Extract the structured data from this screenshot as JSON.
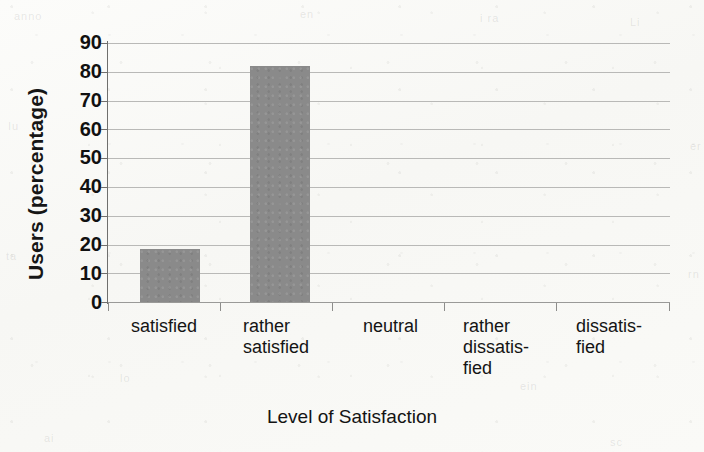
{
  "chart_data": {
    "type": "bar",
    "title": "",
    "xlabel": "Level of Satisfaction",
    "ylabel": "Users (percentage)",
    "categories": [
      "satisfied",
      "rather satisfied",
      "neutral",
      "rather dissatisfied",
      "dissatisfied"
    ],
    "category_labels_wrapped": [
      "satisfied",
      "rather\nsatisfied",
      "neutral",
      "rather\ndissatis-\nfied",
      "dissatis-\nfied"
    ],
    "values": [
      18.5,
      82,
      0,
      0,
      0
    ],
    "ylim": [
      0,
      90
    ],
    "yticks": [
      0,
      10,
      20,
      30,
      40,
      50,
      60,
      70,
      80,
      90
    ],
    "ytick_labels": [
      "0",
      "10",
      "20",
      "30",
      "40",
      "50",
      "60",
      "70",
      "80",
      "90"
    ],
    "grid": true,
    "grid_axis": "y",
    "legend": false,
    "legend_position": "none",
    "bar_color": "#8a8a8a",
    "grid_color": "#b9b9b7",
    "axis_color": "#6f6f6d",
    "background_color": "#fbfbf9",
    "text_color": "#141414"
  },
  "ghost_marks": [
    {
      "text": "anno",
      "x": 14,
      "y": 10
    },
    {
      "text": "en",
      "x": 300,
      "y": 8
    },
    {
      "text": "i ra",
      "x": 480,
      "y": 12
    },
    {
      "text": "Li",
      "x": 630,
      "y": 16
    },
    {
      "text": "Iu",
      "x": 8,
      "y": 120
    },
    {
      "text": "er",
      "x": 690,
      "y": 140
    },
    {
      "text": "ta",
      "x": 6,
      "y": 250
    },
    {
      "text": "rn",
      "x": 688,
      "y": 268
    },
    {
      "text": "lo",
      "x": 120,
      "y": 372
    },
    {
      "text": "ein",
      "x": 520,
      "y": 380
    },
    {
      "text": "ai",
      "x": 44,
      "y": 432
    },
    {
      "text": "sc",
      "x": 610,
      "y": 436
    }
  ]
}
